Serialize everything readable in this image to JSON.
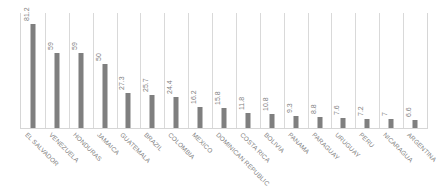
{
  "chart_data": {
    "type": "bar",
    "title": "",
    "subtitle": "",
    "xlabel": "",
    "ylabel": "",
    "ylim": [
      0,
      90
    ],
    "grid": "vertical-category-separators",
    "legend": "none",
    "orientation": "vertical",
    "bar_color": "#7f7f7f",
    "gridline_color": "#d9d9d9",
    "label_color": "#808080",
    "categories": [
      "EL SALVADOR",
      "VENEZUELA",
      "HONDURAS",
      "JAMAICA",
      "GUATEMALA",
      "BRAZIL",
      "COLOMBIA",
      "MEXICO",
      "DOMINICAN REPUBLIC",
      "COSTA RICA",
      "BOLIVIA",
      "PANAMA",
      "PARAGUAY",
      "URUGUAY",
      "PERU",
      "NICARAGUA",
      "ARGENTINA"
    ],
    "values": [
      81.2,
      59,
      59,
      50,
      27.3,
      25.7,
      24.4,
      16.2,
      15.8,
      11.8,
      10.8,
      9.3,
      8.8,
      7.6,
      7.2,
      7,
      6.6
    ],
    "value_labels": [
      "81.2",
      "59",
      "59",
      "50",
      "27.3",
      "25.7",
      "24.4",
      "16.2",
      "15.8",
      "11.8",
      "10.8",
      "9.3",
      "8.8",
      "7.6",
      "7.2",
      "7",
      "6.6"
    ]
  }
}
